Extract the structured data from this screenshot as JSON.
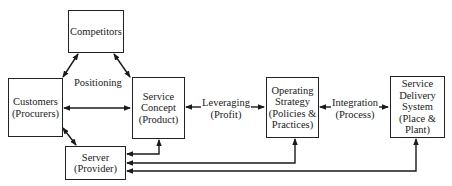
{
  "diagram": {
    "nodes": {
      "competitors": {
        "lines": [
          "Competitors"
        ]
      },
      "customers": {
        "lines": [
          "Customers",
          "(Procurers)"
        ]
      },
      "service_concept": {
        "lines": [
          "Service",
          "Concept",
          "(Product)"
        ]
      },
      "operating_strategy": {
        "lines": [
          "Operating",
          "Strategy",
          "(Policies &",
          "Practices)"
        ]
      },
      "delivery_system": {
        "lines": [
          "Service",
          "Delivery",
          "System",
          "(Place &",
          "Plant)"
        ]
      },
      "server": {
        "lines": [
          "Server",
          "(Provider)"
        ]
      }
    },
    "edge_labels": {
      "positioning": "Positioning",
      "leveraging": {
        "lines": [
          "Leveraging",
          "(Profit)"
        ]
      },
      "integration": {
        "lines": [
          "Integration",
          "(Process)"
        ]
      }
    },
    "edges": [
      {
        "from": "competitors",
        "to": "customers",
        "type": "bidirectional"
      },
      {
        "from": "competitors",
        "to": "service_concept",
        "type": "bidirectional"
      },
      {
        "from": "customers",
        "to": "service_concept",
        "type": "bidirectional",
        "label": "Positioning"
      },
      {
        "from": "customers",
        "to": "server",
        "type": "bidirectional"
      },
      {
        "from": "service_concept",
        "to": "operating_strategy",
        "type": "bidirectional",
        "label": "Leveraging (Profit)"
      },
      {
        "from": "operating_strategy",
        "to": "delivery_system",
        "type": "bidirectional",
        "label": "Integration (Process)"
      },
      {
        "from": "server",
        "to": "service_concept",
        "type": "bidirectional"
      },
      {
        "from": "server",
        "to": "operating_strategy",
        "type": "bidirectional"
      },
      {
        "from": "server",
        "to": "delivery_system",
        "type": "bidirectional"
      }
    ]
  }
}
